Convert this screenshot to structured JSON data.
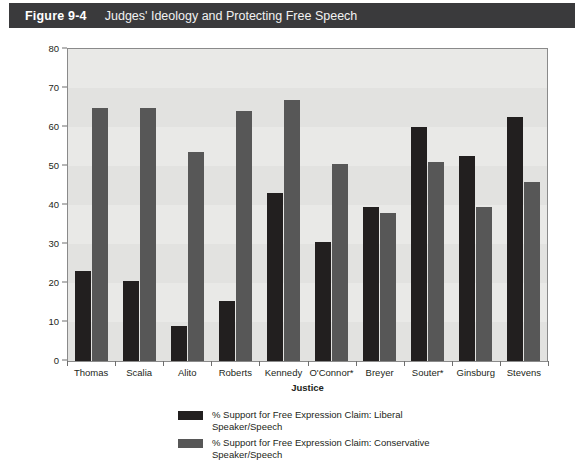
{
  "figure": {
    "number": "Figure 9-4",
    "title": "Judges' Ideology and Protecting Free Speech"
  },
  "chart_data": {
    "type": "bar",
    "title": "Judges' Ideology and Protecting Free Speech",
    "xlabel": "Justice",
    "ylabel": "",
    "ylim": [
      0,
      80
    ],
    "yticks": [
      0,
      10,
      20,
      30,
      40,
      50,
      60,
      70,
      80
    ],
    "grid": false,
    "legend_position": "bottom",
    "categories": [
      "Thomas",
      "Scalia",
      "Alito",
      "Roberts",
      "Kennedy",
      "O'Connor*",
      "Breyer",
      "Souter*",
      "Ginsburg",
      "Stevens"
    ],
    "series": [
      {
        "name": "% Support for Free Expression Claim: Liberal Speaker/Speech",
        "color": "#221f1f",
        "values": [
          23,
          20.5,
          9,
          15.5,
          43,
          30.5,
          39.5,
          60,
          52.5,
          62.5
        ]
      },
      {
        "name": "% Support for Free Expression Claim: Conservative Speaker/Speech",
        "color": "#575757",
        "values": [
          65,
          65,
          53.5,
          64,
          67,
          50.5,
          38,
          51,
          39.5,
          46
        ]
      }
    ]
  },
  "legend": {
    "items": [
      {
        "label": "% Support for Free Expression Claim: Liberal Speaker/Speech",
        "swatch": "liberal"
      },
      {
        "label": "% Support for Free Expression Claim: Conservative Speaker/Speech",
        "swatch": "conservative"
      }
    ]
  },
  "colors": {
    "header_bar": "#3a3a3c",
    "plot_background": "#e9e9e7",
    "liberal": "#221f1f",
    "conservative": "#575757"
  }
}
